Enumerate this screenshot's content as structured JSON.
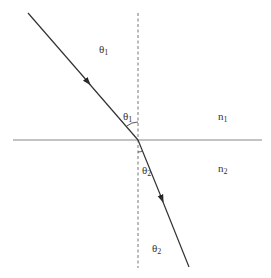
{
  "diagram": {
    "type": "refraction",
    "colors": {
      "ray": "#333333",
      "interface": "#888888",
      "normal": "#777777",
      "text": "#333333"
    },
    "labels": {
      "theta1_region": {
        "base": "θ",
        "sub": "1"
      },
      "theta1_angle": {
        "base": "θ",
        "sub": "1"
      },
      "theta2_angle": {
        "base": "θ",
        "sub": "2"
      },
      "theta2_region": {
        "base": "θ",
        "sub": "2"
      },
      "n1": {
        "base": "n",
        "sub": "1"
      },
      "n2": {
        "base": "n",
        "sub": "2"
      }
    },
    "geometry": {
      "interface_y": 140,
      "normal_x": 138,
      "incident_start": [
        28,
        13
      ],
      "incidence_point": [
        138,
        140
      ],
      "refracted_end": [
        189,
        267
      ]
    }
  }
}
